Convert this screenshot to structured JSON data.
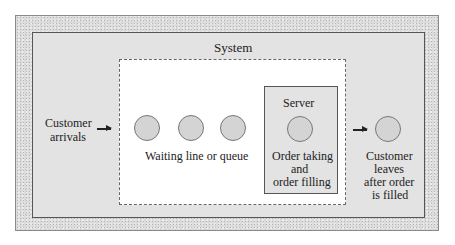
{
  "diagram": {
    "type": "single-server queuing system",
    "system_label": "System",
    "input": {
      "label_line1": "Customer",
      "label_line2": "arrivals"
    },
    "queue": {
      "label": "Waiting line or queue",
      "customer_count": 3
    },
    "server": {
      "title": "Server",
      "label_line1": "Order taking",
      "label_line2": "and",
      "label_line3": "order filling"
    },
    "output": {
      "label_line1": "Customer",
      "label_line2": "leaves",
      "label_line3": "after order",
      "label_line4": "is filled"
    },
    "colors": {
      "outer_frame": "#dcdcdc",
      "system_panel": "#e3e3e3",
      "queue_area": "#ffffff",
      "customer_circle": "#d4d4d4",
      "lines": "#555555"
    }
  }
}
